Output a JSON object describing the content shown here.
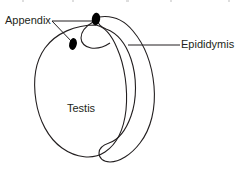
{
  "figure": {
    "background_color": "#ffffff",
    "stroke_color": "#231f20",
    "marker_color": "#000000",
    "labels": {
      "appendix": "Appendix",
      "epididymis": "Epididymis",
      "testis": "Testis"
    },
    "label_positions": {
      "appendix": {
        "x": 5,
        "y": 24
      },
      "epididymis": {
        "x": 181,
        "y": 48
      },
      "testis": {
        "x": 67,
        "y": 112
      }
    },
    "leader_lines": [
      {
        "name": "appendix-to-upper-marker",
        "x1": 52,
        "y1": 21,
        "x2": 93,
        "y2": 21
      },
      {
        "name": "appendix-to-lower-marker",
        "x1": 52,
        "y1": 21,
        "x2": 73,
        "y2": 43
      },
      {
        "name": "epididymis-leader",
        "x1": 128,
        "y1": 45,
        "x2": 180,
        "y2": 45
      }
    ],
    "markers": [
      {
        "name": "appendix-testis-marker",
        "cx": 96,
        "cy": 19,
        "rx": 4.2,
        "ry": 6.2,
        "rotation": 8
      },
      {
        "name": "appendix-epididymis-marker",
        "cx": 73,
        "cy": 44,
        "rx": 3.8,
        "ry": 6.0,
        "rotation": 12
      }
    ],
    "shapes": {
      "testis": {
        "name": "testis-outline",
        "path": "M 96 25 C 75 25 56 33 45 48 C 35 62 33 82 36 101 C 39 120 48 138 62 148 C 76 158 93 160 105 152 C 117 144 124 128 126 110 C 128 90 125 66 117 48 C 112 36 106 27 96 25 Z"
      },
      "epididymis_outer": {
        "name": "epididymis-outline",
        "path": "M 99 17 C 112 15 124 20 133 31 C 144 44 152 64 154 86 C 156 108 151 129 140 143 C 131 155 119 162 110 162 C 103 162 99 158 99 153 C 99 148 103 145 109 143 C 118 140 126 130 131 116 C 137 99 137 77 131 59 C 126 44 117 33 106 29 C 101 27 98 24 98 21 C 98 19 98 17 99 17 Z"
      },
      "epididymis_head_hook": {
        "name": "epididymis-head-curve",
        "path": "M 93 22 C 86 26 81 32 81 38 C 81 43 85 47 91 48 C 97 49 104 47 110 43"
      }
    }
  }
}
